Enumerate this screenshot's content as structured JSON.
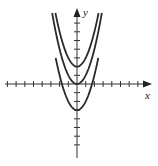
{
  "diagram": {
    "type": "function-graph",
    "axes": {
      "x_label": "x",
      "y_label": "y",
      "x_ticks_left": 8,
      "x_ticks_right": 7,
      "y_ticks_up": 7,
      "y_ticks_down": 7
    },
    "curves": [
      {
        "name": "upper-parabola",
        "equation": "y = x^2 + 2",
        "vertex": [
          0,
          2
        ]
      },
      {
        "name": "middle-parabola",
        "equation": "y = x^2",
        "vertex": [
          0,
          0
        ]
      },
      {
        "name": "lower-parabola",
        "equation": "y = x^2 - 3",
        "vertex": [
          0,
          -3
        ]
      }
    ],
    "colors": {
      "curve": "#2a2a2a",
      "axis": "#333333"
    }
  }
}
